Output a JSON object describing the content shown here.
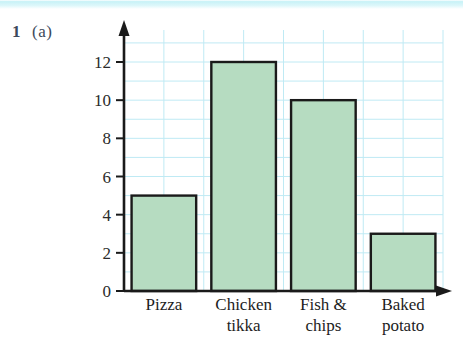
{
  "question": {
    "number": "1",
    "part": "(a)"
  },
  "chart_data": {
    "type": "bar",
    "title": "",
    "subtitle": "",
    "xlabel": "",
    "ylabel": "",
    "categories": [
      "Pizza",
      "Chicken tikka",
      "Fish & chips",
      "Baked potato"
    ],
    "category_lines": [
      [
        "Pizza"
      ],
      [
        "Chicken",
        "tikka"
      ],
      [
        "Fish &",
        "chips"
      ],
      [
        "Baked",
        "potato"
      ]
    ],
    "values": [
      5,
      12,
      10,
      3
    ],
    "ylim": [
      0,
      13
    ],
    "ytick_labels": [
      "0",
      "2",
      "4",
      "6",
      "8",
      "10",
      "12"
    ],
    "ytick_values": [
      0,
      2,
      4,
      6,
      8,
      10,
      12
    ],
    "grid": true,
    "grid_step": 1,
    "legend": "none",
    "bar_fill": "#b6dcc1",
    "bar_stroke": "#1a1a1a",
    "grid_color": "#bfeaf4",
    "axis_color": "#1a1a1a"
  },
  "colors": {
    "label_text": "#3d4a5c",
    "tick_text": "#2b2b2b",
    "background": "#ffffff",
    "top_band": "#c8f2f7"
  }
}
